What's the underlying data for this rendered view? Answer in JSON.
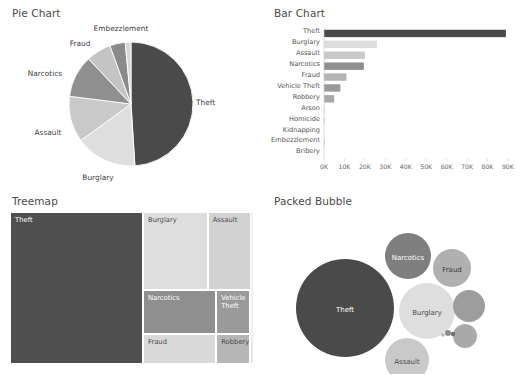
{
  "panels": {
    "pie": {
      "title": "Pie Chart"
    },
    "bar": {
      "title": "Bar Chart"
    },
    "treemap": {
      "title": "Treemap"
    },
    "bubble": {
      "title": "Packed Bubble"
    }
  },
  "colors": {
    "theft": "#4a4a4a",
    "burglary": "#dedede",
    "assault": "#c9c9c9",
    "narcotics": "#8f8f8f",
    "fraud": "#b4b4b4",
    "vehicle_theft": "#9a9a9a",
    "robbery": "#a8a8a8",
    "arson": "#d4d4d4",
    "homicide": "#bcbcbc",
    "kidnapping": "#cccccc",
    "embezzlement": "#a0a0a0",
    "bribery": "#dddddd",
    "background": "#ffffff",
    "text": "#4a4a4a",
    "axis": "#cfcfcf"
  },
  "labels": {
    "theft": "Theft",
    "burglary": "Burglary",
    "assault": "Assault",
    "narcotics": "Narcotics",
    "fraud": "Fraud",
    "vehicle_theft": "Vehicle Theft",
    "robbery": "Robbery",
    "arson": "Arson",
    "homicide": "Homicide",
    "kidnapping": "Kidnapping",
    "embezzlement": "Embezzlement",
    "bribery": "Bribery",
    "vehicle_theft_wrapped": "Vehicle\nTheft"
  },
  "chart_data": [
    {
      "type": "pie",
      "title": "Pie Chart",
      "categories": [
        "Theft",
        "Burglary",
        "Assault",
        "Narcotics",
        "Fraud",
        "Embezzlement"
      ],
      "values": [
        89000,
        26000,
        20000,
        19500,
        11000,
        8000
      ],
      "labels_shown": [
        "Theft",
        "Burglary",
        "Assault",
        "Narcotics",
        "Fraud",
        "Embezzlement"
      ],
      "colors": [
        "#4a4a4a",
        "#dedede",
        "#c9c9c9",
        "#8f8f8f",
        "#b4b4b4",
        "#9a9a9a"
      ],
      "legend": "none",
      "grid": false
    },
    {
      "type": "bar",
      "title": "Bar Chart",
      "orientation": "horizontal",
      "categories": [
        "Theft",
        "Burglary",
        "Assault",
        "Narcotics",
        "Fraud",
        "Vehicle Theft",
        "Robbery",
        "Arson",
        "Homicide",
        "Kidnapping",
        "Embezzlement",
        "Bribery"
      ],
      "values": [
        89000,
        26000,
        20000,
        19500,
        11000,
        8000,
        5000,
        400,
        300,
        200,
        150,
        100
      ],
      "xlabel": "",
      "ylabel": "",
      "xlim": [
        0,
        90000
      ],
      "xticks": [
        0,
        10000,
        20000,
        30000,
        40000,
        50000,
        60000,
        70000,
        80000,
        90000
      ],
      "xticklabels": [
        "0K",
        "10K",
        "20K",
        "30K",
        "40K",
        "50K",
        "60K",
        "70K",
        "80K",
        "90K"
      ],
      "grid": false,
      "legend": "none"
    },
    {
      "type": "treemap",
      "title": "Treemap",
      "categories": [
        "Theft",
        "Burglary",
        "Assault",
        "Narcotics",
        "Vehicle Theft",
        "Fraud",
        "Robbery"
      ],
      "values": [
        89000,
        26000,
        20000,
        19500,
        8000,
        11000,
        5000
      ],
      "grid": false,
      "legend": "none"
    },
    {
      "type": "scatter",
      "subtype": "packed-bubble",
      "title": "Packed Bubble",
      "categories": [
        "Theft",
        "Narcotics",
        "Fraud",
        "Burglary",
        "Assault",
        "Vehicle Theft",
        "Robbery"
      ],
      "values": [
        89000,
        19500,
        14000,
        26000,
        11000,
        8000,
        5000
      ],
      "grid": false,
      "legend": "none"
    }
  ],
  "pie_slices": [
    {
      "label": "Theft",
      "pct": 49.0,
      "color": "#4a4a4a",
      "label_x": 196,
      "label_y": 85,
      "anchor": "start"
    },
    {
      "label": "Burglary",
      "pct": 16.0,
      "color": "#dedede",
      "label_x": 98,
      "label_y": 160,
      "anchor": "middle"
    },
    {
      "label": "Assault",
      "pct": 12.0,
      "color": "#c9c9c9",
      "label_x": 48,
      "label_y": 115,
      "anchor": "middle"
    },
    {
      "label": "Narcotics",
      "pct": 11.0,
      "color": "#8f8f8f",
      "label_x": 45,
      "label_y": 56,
      "anchor": "middle"
    },
    {
      "label": "Fraud",
      "pct": 6.5,
      "color": "#c4c4c4",
      "label_x": 80,
      "label_y": 26,
      "anchor": "middle"
    },
    {
      "label": "Embezzlement",
      "pct": 4.0,
      "color": "#8a8a8a",
      "label_x": 121,
      "label_y": 11,
      "anchor": "middle"
    },
    {
      "label": "",
      "pct": 1.5,
      "color": "#d8d8d8",
      "label_x": 0,
      "label_y": 0,
      "anchor": "middle"
    }
  ],
  "bar_rows": [
    {
      "label": "Theft",
      "value": 89000,
      "color": "#4a4a4a"
    },
    {
      "label": "Burglary",
      "value": 26000,
      "color": "#dedede"
    },
    {
      "label": "Assault",
      "value": 20000,
      "color": "#c9c9c9"
    },
    {
      "label": "Narcotics",
      "value": 19500,
      "color": "#8f8f8f"
    },
    {
      "label": "Fraud",
      "value": 11000,
      "color": "#b4b4b4"
    },
    {
      "label": "Vehicle Theft",
      "value": 8000,
      "color": "#9a9a9a"
    },
    {
      "label": "Robbery",
      "value": 5000,
      "color": "#a8a8a8"
    },
    {
      "label": "Arson",
      "value": 400,
      "color": "#d4d4d4"
    },
    {
      "label": "Homicide",
      "value": 300,
      "color": "#bcbcbc"
    },
    {
      "label": "Kidnapping",
      "value": 0,
      "color": "#cccccc"
    },
    {
      "label": "Embezzlement",
      "value": 200,
      "color": "#a0a0a0"
    },
    {
      "label": "Bribery",
      "value": 0,
      "color": "#dddddd"
    }
  ],
  "treemap_cells": [
    {
      "label": "Theft",
      "color": "#4f4f4f",
      "text": "dark",
      "x": 0,
      "y": 0,
      "w": 54.5,
      "h": 100
    },
    {
      "label": "Burglary",
      "color": "#dedede",
      "text": "light",
      "x": 54.5,
      "y": 0,
      "w": 26.5,
      "h": 51
    },
    {
      "label": "Assault",
      "color": "#d2d2d2",
      "text": "light",
      "x": 81,
      "y": 0,
      "w": 19,
      "h": 51
    },
    {
      "label": "Narcotics",
      "color": "#8f8f8f",
      "text": "dark",
      "x": 54.5,
      "y": 51,
      "w": 30,
      "h": 29
    },
    {
      "label": "Vehicle Theft",
      "color": "#9a9a9a",
      "text": "dark",
      "x": 84.5,
      "y": 51,
      "w": 14,
      "h": 29
    },
    {
      "label": "Fraud",
      "color": "#d9d9d9",
      "text": "light",
      "x": 54.5,
      "y": 80,
      "w": 30,
      "h": 20
    },
    {
      "label": "Robbery",
      "color": "#b6b6b6",
      "text": "light",
      "x": 84.5,
      "y": 80,
      "w": 14,
      "h": 20
    },
    {
      "label": "",
      "color": "#e8e8e8",
      "text": "light",
      "x": 98.5,
      "y": 80,
      "w": 1.5,
      "h": 20
    },
    {
      "label": "",
      "color": "#f0f0f0",
      "text": "light",
      "x": 98.5,
      "y": 0,
      "w": 1.5,
      "h": 80
    }
  ],
  "bubbles": [
    {
      "label": "Theft",
      "cx": 83,
      "cy": 100,
      "r": 49,
      "color": "#4a4a4a",
      "text": "#ffffff",
      "show": true
    },
    {
      "label": "Narcotics",
      "cx": 146,
      "cy": 48,
      "r": 23,
      "color": "#7f7f7f",
      "text": "#ffffff",
      "show": true
    },
    {
      "label": "Fraud",
      "cx": 190,
      "cy": 60,
      "r": 19,
      "color": "#b0b0b0",
      "text": "#3a3a3a",
      "show": true
    },
    {
      "label": "Burglary",
      "cx": 165,
      "cy": 103,
      "r": 28,
      "color": "#dedede",
      "text": "#4a4a4a",
      "show": true
    },
    {
      "label": "Assault",
      "cx": 145,
      "cy": 152,
      "r": 22,
      "color": "#c9c9c9",
      "text": "#4a4a4a",
      "show": true
    },
    {
      "label": "Vehicle Theft",
      "cx": 207,
      "cy": 98,
      "r": 16,
      "color": "#9d9d9d",
      "text": "#ffffff",
      "show": false
    },
    {
      "label": "Robbery",
      "cx": 203,
      "cy": 128,
      "r": 12,
      "color": "#a9a9a9",
      "text": "#ffffff",
      "show": false
    },
    {
      "label": "Arson",
      "cx": 186,
      "cy": 125,
      "r": 3,
      "color": "#8a8a8a",
      "text": "#ffffff",
      "show": false
    },
    {
      "label": "Homicide",
      "cx": 191,
      "cy": 126,
      "r": 2.2,
      "color": "#6f6f6f",
      "text": "#ffffff",
      "show": false
    },
    {
      "label": "Kidnapping",
      "cx": 181,
      "cy": 127,
      "r": 1.8,
      "color": "#b5b5b5",
      "text": "#ffffff",
      "show": false
    }
  ]
}
